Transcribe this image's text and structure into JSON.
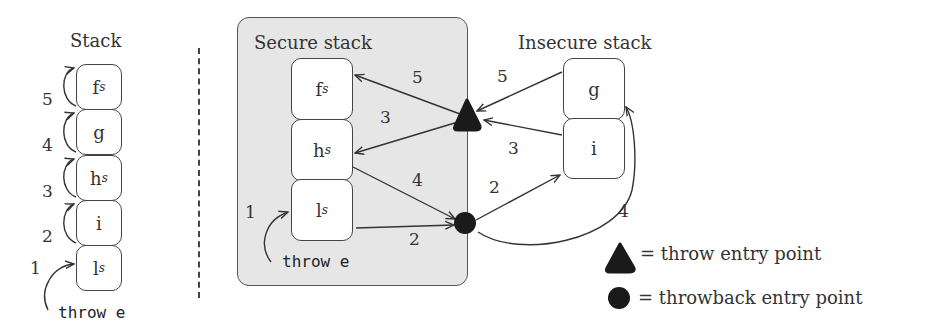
{
  "left_panel": {
    "title": "Stack",
    "frames": [
      {
        "base": "f",
        "sub": "s"
      },
      {
        "base": "g",
        "sub": ""
      },
      {
        "base": "h",
        "sub": "s"
      },
      {
        "base": "i",
        "sub": ""
      },
      {
        "base": "l",
        "sub": "s"
      }
    ],
    "step_labels": [
      "5",
      "4",
      "3",
      "2",
      "1"
    ],
    "trigger": "throw e"
  },
  "secure_stack": {
    "title": "Secure stack",
    "frames": [
      {
        "base": "f",
        "sub": "s"
      },
      {
        "base": "h",
        "sub": "s"
      },
      {
        "base": "l",
        "sub": "s"
      }
    ],
    "trigger": "throw e",
    "trigger_step": "1"
  },
  "insecure_stack": {
    "title": "Insecure stack",
    "frames": [
      {
        "base": "g",
        "sub": ""
      },
      {
        "base": "i",
        "sub": ""
      }
    ]
  },
  "edge_labels": {
    "l_to_throwback": "2",
    "throwback_to_i": "2",
    "i_to_throw": "3",
    "throw_to_h": "3",
    "h_to_throwback": "4",
    "throwback_to_g": "4",
    "g_to_throw": "5",
    "throw_to_f": "5"
  },
  "legend": {
    "throw_symbol": "triangle",
    "throw_label": "= throw entry point",
    "throwback_symbol": "circle",
    "throwback_label": "= throwback entry point"
  },
  "colors": {
    "secure_fill": "#e6e6e6",
    "entry_point": "#1a1a1a",
    "stroke": "#444444"
  }
}
